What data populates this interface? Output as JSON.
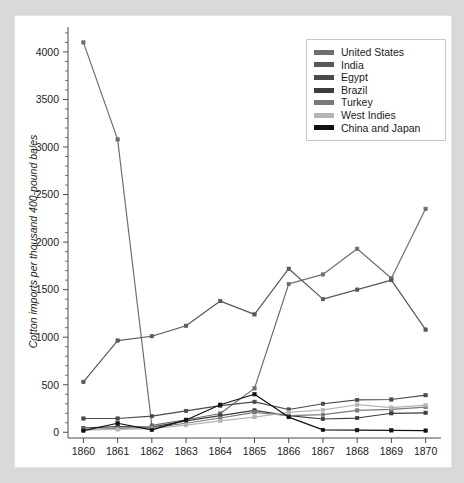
{
  "chart_data": {
    "type": "line",
    "title": "",
    "xlabel": "",
    "ylabel": "Cotton imports per thousand 400-pound bales",
    "x": [
      1860,
      1861,
      1862,
      1863,
      1864,
      1865,
      1866,
      1867,
      1868,
      1869,
      1870
    ],
    "xtick_labels": [
      "1860",
      "1861",
      "1862",
      "1863",
      "1864",
      "1865",
      "1866",
      "1867",
      "1868",
      "1869",
      "1870"
    ],
    "ytick_labels": [
      "0",
      "500",
      "1000",
      "1500",
      "2000",
      "2500",
      "3000",
      "3500",
      "4000"
    ],
    "yticks": [
      0,
      500,
      1000,
      1500,
      2000,
      2500,
      3000,
      3500,
      4000
    ],
    "xlim": [
      1859.55,
      1870.45
    ],
    "ylim": [
      -60,
      4220
    ],
    "minor_ticks": true,
    "grid": false,
    "legend_position": "top-right",
    "markers": "square",
    "series": [
      {
        "name": "United States",
        "color": "#6e6e6e",
        "values": [
          4100,
          3080,
          72,
          132,
          198,
          462,
          1560,
          1660,
          1930,
          1620,
          2350
        ]
      },
      {
        "name": "India",
        "color": "#585858",
        "values": [
          530,
          965,
          1010,
          1120,
          1380,
          1240,
          1720,
          1400,
          1500,
          1600,
          1080
        ]
      },
      {
        "name": "Egypt",
        "color": "#4a4a4a",
        "values": [
          145,
          145,
          170,
          225,
          280,
          320,
          240,
          300,
          340,
          345,
          390
        ]
      },
      {
        "name": "Brazil",
        "color": "#3c3c3c",
        "values": [
          45,
          60,
          55,
          120,
          175,
          230,
          175,
          140,
          150,
          200,
          205
        ]
      },
      {
        "name": "Turkey",
        "color": "#7a7a7a",
        "values": [
          30,
          40,
          50,
          95,
          150,
          210,
          175,
          185,
          230,
          240,
          265
        ]
      },
      {
        "name": "West Indies",
        "color": "#b5b5b5",
        "values": [
          22,
          30,
          38,
          75,
          120,
          160,
          210,
          235,
          290,
          260,
          285
        ]
      },
      {
        "name": "China and Japan",
        "color": "#111111",
        "values": [
          18,
          95,
          25,
          130,
          290,
          400,
          160,
          25,
          22,
          20,
          18
        ]
      }
    ]
  },
  "legend": {
    "items": [
      {
        "label": "United States",
        "color": "#6e6e6e"
      },
      {
        "label": "India",
        "color": "#585858"
      },
      {
        "label": "Egypt",
        "color": "#4a4a4a"
      },
      {
        "label": "Brazil",
        "color": "#3c3c3c"
      },
      {
        "label": "Turkey",
        "color": "#7a7a7a"
      },
      {
        "label": "West Indies",
        "color": "#b5b5b5"
      },
      {
        "label": "China and Japan",
        "color": "#111111"
      }
    ]
  }
}
